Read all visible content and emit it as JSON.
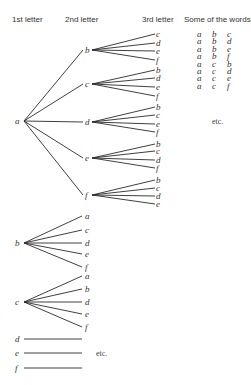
{
  "headers": {
    "first": "1st letter",
    "second": "2nd letter",
    "third": "3rd letter",
    "words": "Some of the words"
  },
  "tree": {
    "a": {
      "label": "a",
      "children": [
        {
          "label": "b",
          "leaves": [
            "c",
            "d",
            "e",
            "f"
          ]
        },
        {
          "label": "c",
          "leaves": [
            "b",
            "d",
            "e",
            "f"
          ]
        },
        {
          "label": "d",
          "leaves": [
            "b",
            "c",
            "e",
            "f"
          ]
        },
        {
          "label": "e",
          "leaves": [
            "b",
            "c",
            "d",
            "f"
          ]
        },
        {
          "label": "f",
          "leaves": [
            "b",
            "c",
            "d",
            "e"
          ]
        }
      ]
    },
    "b": {
      "label": "b",
      "children": [
        "a",
        "c",
        "d",
        "e",
        "f"
      ]
    },
    "c": {
      "label": "c",
      "children": [
        "a",
        "b",
        "d",
        "e",
        "f"
      ]
    },
    "d": {
      "label": "d"
    },
    "e": {
      "label": "e"
    },
    "f": {
      "label": "f"
    }
  },
  "words": [
    [
      "a",
      "b",
      "c"
    ],
    [
      "a",
      "b",
      "d"
    ],
    [
      "a",
      "b",
      "e"
    ],
    [
      "a",
      "b",
      "f"
    ],
    [
      "a",
      "c",
      "b"
    ],
    [
      "a",
      "c",
      "d"
    ],
    [
      "a",
      "c",
      "e"
    ],
    [
      "a",
      "c",
      "f"
    ]
  ],
  "etc_words": "etc.",
  "etc_tree": "etc."
}
